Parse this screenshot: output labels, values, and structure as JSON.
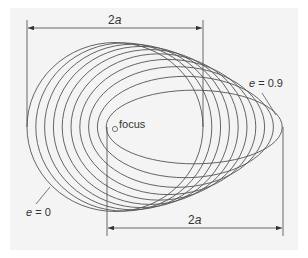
{
  "diagram": {
    "colors": {
      "background": "#f4f4f4",
      "stroke": "#555555",
      "text": "#333333"
    },
    "geometry": {
      "focus": [
        115,
        127
      ],
      "semi_major_axis_px": 88,
      "eccentricities": [
        0,
        0.1,
        0.2,
        0.3,
        0.4,
        0.5,
        0.6,
        0.7,
        0.8,
        0.9
      ]
    },
    "labels": {
      "top_dimension_var": "a",
      "top_dimension_coef": "2",
      "bottom_dimension_var": "a",
      "bottom_dimension_coef": "2",
      "focus": "focus",
      "e_max_var": "e",
      "e_max_value": " = 0.9",
      "e_min_var": "e",
      "e_min_value": " = 0"
    }
  }
}
